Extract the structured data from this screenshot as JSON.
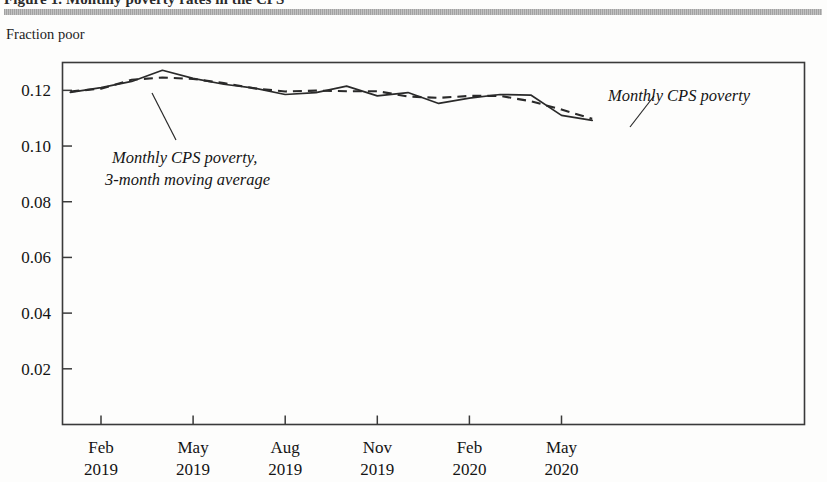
{
  "figure": {
    "caption_cropped": "Figure 1. Monthly poverty rates in the CPS",
    "top_rule_color": "#a8a8a8"
  },
  "chart_data": {
    "type": "line",
    "title": "",
    "xlabel": "",
    "ylabel": "Fraction poor",
    "ylim": [
      0,
      0.13
    ],
    "xlim": [
      "2019-01",
      "2020-06"
    ],
    "grid": false,
    "legend_position": "inline-annotations",
    "y_ticks": [
      "0.12",
      "0.10",
      "0.08",
      "0.06",
      "0.04",
      "0.02"
    ],
    "y_tick_values": [
      0.12,
      0.1,
      0.08,
      0.06,
      0.04,
      0.02
    ],
    "x_ticks": [
      {
        "month": "Feb",
        "year": "2019",
        "index": 1
      },
      {
        "month": "May",
        "year": "2019",
        "index": 4
      },
      {
        "month": "Aug",
        "year": "2019",
        "index": 7
      },
      {
        "month": "Nov",
        "year": "2019",
        "index": 10
      },
      {
        "month": "Feb",
        "year": "2020",
        "index": 13
      },
      {
        "month": "May",
        "year": "2020",
        "index": 16
      }
    ],
    "x": [
      "2019-01",
      "2019-02",
      "2019-03",
      "2019-04",
      "2019-05",
      "2019-06",
      "2019-07",
      "2019-08",
      "2019-09",
      "2019-10",
      "2019-11",
      "2019-12",
      "2020-01",
      "2020-02",
      "2020-03",
      "2020-04",
      "2020-05",
      "2020-06"
    ],
    "series": [
      {
        "name": "Monthly CPS poverty",
        "style": "solid",
        "color": "#2a2a2a",
        "values": [
          0.1193,
          0.121,
          0.1232,
          0.1272,
          0.1243,
          0.1222,
          0.1208,
          0.1185,
          0.1192,
          0.1215,
          0.118,
          0.1192,
          0.1153,
          0.1172,
          0.1185,
          0.1183,
          0.111,
          0.1092
        ]
      },
      {
        "name": "Monthly CPS poverty, 3-month moving average",
        "style": "dashed",
        "color": "#2a2a2a",
        "values": [
          0.1196,
          0.1206,
          0.1238,
          0.1246,
          0.1241,
          0.1226,
          0.1207,
          0.1196,
          0.1199,
          0.1197,
          0.1197,
          0.1178,
          0.1173,
          0.118,
          0.118,
          0.1161,
          0.1131,
          0.1098
        ]
      }
    ],
    "annotations": [
      {
        "id": "annotation-moving-average",
        "lines": [
          "Monthly CPS poverty,",
          "3-month moving average"
        ],
        "anchor_x": 0.205,
        "anchor_y": 0.122
      },
      {
        "id": "annotation-monthly",
        "lines": [
          "Monthly CPS poverty"
        ],
        "anchor_x": 0.745,
        "anchor_y": 0.1085
      }
    ]
  }
}
